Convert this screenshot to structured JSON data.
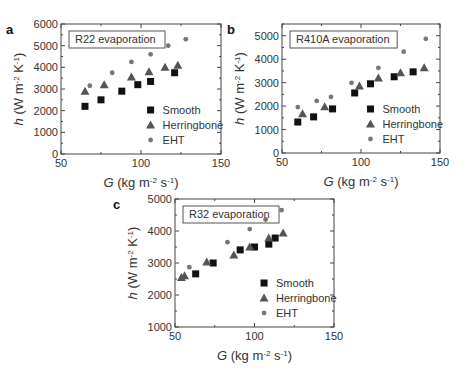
{
  "chart_data": [
    {
      "panel": "a",
      "type": "scatter",
      "title": "R22 evaporation",
      "xlabel": "G (kg m^-2 s^-1)",
      "ylabel": "h (W m^-2 K^-1)",
      "xlim": [
        50,
        150
      ],
      "ylim": [
        0,
        6000
      ],
      "xticks": [
        50,
        100,
        150
      ],
      "yticks": [
        0,
        1000,
        2000,
        3000,
        4000,
        5000,
        6000
      ],
      "legend_position": "lower right",
      "series": [
        {
          "name": "Smooth",
          "marker": "square",
          "points": [
            [
              65,
              2200
            ],
            [
              75,
              2500
            ],
            [
              88,
              2900
            ],
            [
              98,
              3200
            ],
            [
              106,
              3350
            ],
            [
              121,
              3750
            ]
          ]
        },
        {
          "name": "Herringbone",
          "marker": "triangle",
          "points": [
            [
              65,
              2900
            ],
            [
              77,
              3200
            ],
            [
              94,
              3550
            ],
            [
              105,
              3800
            ],
            [
              115,
              4000
            ],
            [
              123,
              4100
            ]
          ]
        },
        {
          "name": "EHT",
          "marker": "circle",
          "points": [
            [
              68,
              3150
            ],
            [
              82,
              3750
            ],
            [
              94,
              4250
            ],
            [
              106,
              4600
            ],
            [
              117,
              5000
            ],
            [
              128,
              5300
            ]
          ]
        }
      ]
    },
    {
      "panel": "b",
      "type": "scatter",
      "title": "R410A evaporation",
      "xlabel": "G (kg m^-2 s^-1)",
      "ylabel": "h (W m^-2 K^-1)",
      "xlim": [
        50,
        150
      ],
      "ylim": [
        0,
        5500
      ],
      "xticks": [
        50,
        100,
        150
      ],
      "yticks": [
        0,
        1000,
        2000,
        3000,
        4000,
        5000
      ],
      "legend_position": "lower right",
      "series": [
        {
          "name": "Smooth",
          "marker": "square",
          "points": [
            [
              60,
              1320
            ],
            [
              70,
              1540
            ],
            [
              82,
              1880
            ],
            [
              96,
              2560
            ],
            [
              106,
              2950
            ],
            [
              121,
              3250
            ],
            [
              133,
              3460
            ]
          ]
        },
        {
          "name": "Herringbone",
          "marker": "triangle",
          "points": [
            [
              63,
              1670
            ],
            [
              77,
              1970
            ],
            [
              99,
              2860
            ],
            [
              111,
              3200
            ],
            [
              125,
              3420
            ],
            [
              140,
              3630
            ]
          ]
        },
        {
          "name": "EHT",
          "marker": "circle",
          "points": [
            [
              60,
              1960
            ],
            [
              72,
              2220
            ],
            [
              81,
              2390
            ],
            [
              94,
              2990
            ],
            [
              111,
              3630
            ],
            [
              127,
              4320
            ],
            [
              141,
              4870
            ]
          ]
        }
      ]
    },
    {
      "panel": "c",
      "type": "scatter",
      "title": "R32 evaporation",
      "xlabel": "G (kg m^-2 s^-1)",
      "ylabel": "h (W m^-2 K^-1)",
      "xlim": [
        50,
        150
      ],
      "ylim": [
        1000,
        5000
      ],
      "xticks": [
        50,
        100,
        150
      ],
      "yticks": [
        1000,
        2000,
        3000,
        4000,
        5000
      ],
      "legend_position": "lower right",
      "series": [
        {
          "name": "Smooth",
          "marker": "square",
          "points": [
            [
              63,
              2660
            ],
            [
              74,
              3000
            ],
            [
              91,
              3410
            ],
            [
              100,
              3500
            ],
            [
              109,
              3590
            ],
            [
              113,
              3780
            ]
          ]
        },
        {
          "name": "Herringbone",
          "marker": "triangle",
          "points": [
            [
              54,
              2550
            ],
            [
              56,
              2600
            ],
            [
              70,
              3030
            ],
            [
              87,
              3250
            ],
            [
              97,
              3500
            ],
            [
              109,
              3780
            ],
            [
              118,
              3940
            ]
          ]
        },
        {
          "name": "EHT",
          "marker": "circle",
          "points": [
            [
              59,
              2870
            ],
            [
              83,
              3650
            ],
            [
              97,
              4060
            ],
            [
              107,
              4360
            ],
            [
              117,
              4650
            ]
          ]
        }
      ]
    }
  ],
  "layout": [
    {
      "left": 61,
      "top": 24,
      "right": 221,
      "bottom": 154
    },
    {
      "left": 282,
      "top": 24,
      "right": 440,
      "bottom": 153
    },
    {
      "left": 175,
      "top": 199,
      "right": 334,
      "bottom": 327
    }
  ],
  "colors": {
    "smooth": "#111111",
    "herringbone": "#555555",
    "eht": "#777777",
    "axis": "#444444"
  }
}
